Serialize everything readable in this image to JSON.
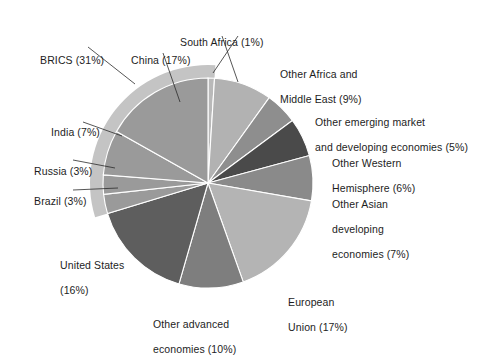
{
  "chart_data": {
    "type": "pie",
    "title": "",
    "subtitle": "",
    "xlabel": "",
    "ylabel": "",
    "legend_position": "callout-labels",
    "grid": false,
    "units": "percent",
    "total": 101,
    "start_angle_deg": 0,
    "direction": "clockwise",
    "categories": [
      "South Africa",
      "Other Africa and Middle East",
      "Other emerging market and developing economies",
      "Other Western Hemisphere",
      "Other Asian developing economies",
      "European Union",
      "Other advanced economies",
      "United States",
      "Brazil",
      "Russia",
      "India",
      "China"
    ],
    "values": [
      1,
      9,
      5,
      6,
      7,
      17,
      10,
      16,
      3,
      3,
      7,
      17
    ],
    "colors": [
      "#b9b9b9",
      "#b2b2b2",
      "#8e8e8e",
      "#4a4a4a",
      "#8a8a8a",
      "#b4b4b4",
      "#7e7e7e",
      "#5e5e5e",
      "#9a9a9a",
      "#9a9a9a",
      "#9a9a9a",
      "#9a9a9a"
    ],
    "slices": [
      {
        "name": "South Africa",
        "value": 1,
        "label": "South Africa (1%)",
        "color": "#b9b9b9",
        "group": "BRICS"
      },
      {
        "name": "Other Africa and Middle East",
        "value": 9,
        "label": "Other Africa and Middle East (9%)",
        "color": "#b2b2b2",
        "group": ""
      },
      {
        "name": "Other emerging market and developing economies",
        "value": 5,
        "label": "Other emerging market and developing economies (5%)",
        "color": "#8e8e8e",
        "group": ""
      },
      {
        "name": "Other Western Hemisphere",
        "value": 6,
        "label": "Other Western Hemisphere (6%)",
        "color": "#4a4a4a",
        "group": ""
      },
      {
        "name": "Other Asian developing economies",
        "value": 7,
        "label": "Other Asian developing economies (7%)",
        "color": "#8a8a8a",
        "group": ""
      },
      {
        "name": "European Union",
        "value": 17,
        "label": "European Union (17%)",
        "color": "#b4b4b4",
        "group": ""
      },
      {
        "name": "Other advanced economies",
        "value": 10,
        "label": "Other advanced economies (10%)",
        "color": "#7e7e7e",
        "group": ""
      },
      {
        "name": "United States",
        "value": 16,
        "label": "United States (16%)",
        "color": "#5e5e5e",
        "group": ""
      },
      {
        "name": "Brazil",
        "value": 3,
        "label": "Brazil (3%)",
        "color": "#9a9a9a",
        "group": "BRICS"
      },
      {
        "name": "Russia",
        "value": 3,
        "label": "Russia (3%)",
        "color": "#9a9a9a",
        "group": "BRICS"
      },
      {
        "name": "India",
        "value": 7,
        "label": "India (7%)",
        "color": "#9a9a9a",
        "group": "BRICS"
      },
      {
        "name": "China",
        "value": 17,
        "label": "China (17%)",
        "color": "#9a9a9a",
        "group": "BRICS"
      }
    ],
    "groups": [
      {
        "name": "BRICS",
        "value": 31,
        "label": "BRICS (31%)",
        "members": [
          "China",
          "India",
          "Russia",
          "Brazil",
          "South Africa"
        ],
        "color": "#c4c4c4"
      }
    ],
    "annotations": [
      {
        "id": "brics",
        "text": "BRICS (31%)"
      },
      {
        "id": "china",
        "text": "China (17%)"
      },
      {
        "id": "south_africa",
        "text": "South Africa (1%)"
      },
      {
        "id": "india",
        "text": "India (7%)"
      },
      {
        "id": "russia",
        "text": "Russia (3%)"
      },
      {
        "id": "brazil",
        "text": "Brazil (3%)"
      },
      {
        "id": "united_states",
        "text": "United States (16%)"
      },
      {
        "id": "other_advanced",
        "text": "Other advanced economies (10%)"
      },
      {
        "id": "european_union",
        "text": "European Union (17%)"
      },
      {
        "id": "other_asian",
        "text": "Other Asian developing economies (7%)"
      },
      {
        "id": "other_western",
        "text": "Other Western Hemisphere (6%)"
      },
      {
        "id": "other_emerging",
        "text": "Other emerging market and developing economies (5%)"
      },
      {
        "id": "other_africa",
        "text": "Other Africa and Middle East (9%)"
      }
    ]
  },
  "labels": {
    "brics_l1": "BRICS (31%)",
    "china_l1": "China (17%)",
    "south_africa_l1": "South Africa (1%)",
    "india_l1": "India (7%)",
    "russia_l1": "Russia (3%)",
    "brazil_l1": "Brazil (3%)",
    "united_states_l1": "United States",
    "united_states_l2": "(16%)",
    "other_advanced_l1": "Other advanced",
    "other_advanced_l2": "economies (10%)",
    "european_union_l1": "European",
    "european_union_l2": "Union (17%)",
    "other_asian_l1": "Other Asian",
    "other_asian_l2": "developing",
    "other_asian_l3": "economies (7%)",
    "other_western_l1": "Other Western",
    "other_western_l2": "Hemisphere (6%)",
    "other_emerging_l1": "Other emerging market",
    "other_emerging_l2": "and developing economies (5%)",
    "other_africa_l1": "Other Africa and",
    "other_africa_l2": "Middle East (9%)"
  },
  "style": {
    "background": "#ffffff",
    "text_color": "#1d1d1d",
    "leader_color": "#2b2b2b",
    "slice_separator": "#ffffff",
    "brics_band_color": "#c4c4c4"
  }
}
